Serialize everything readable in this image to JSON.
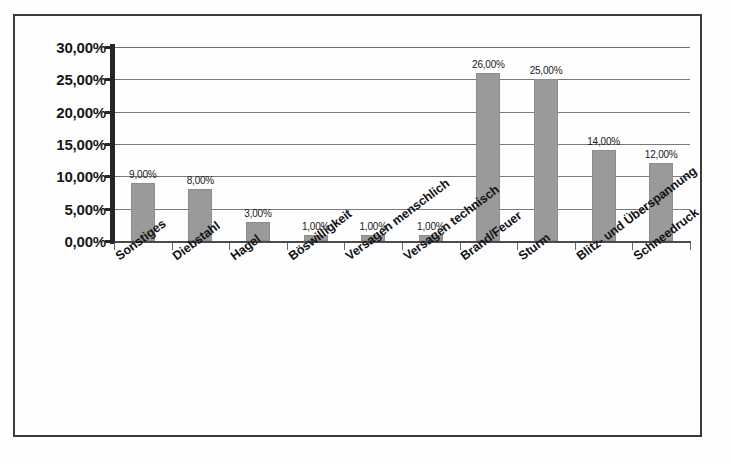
{
  "chart_data": {
    "type": "bar",
    "title": "",
    "subtitle": "",
    "xlabel": "",
    "ylabel": "",
    "categories": [
      "Sonstiges",
      "Diebstahl",
      "Hagel",
      "Böswilligkeit",
      "Versagen menschlich",
      "Versagen technisch",
      "Brand/Feuer",
      "Sturm",
      "Blitz- und Überspannung",
      "Schneedruck"
    ],
    "values": [
      9,
      8,
      3,
      1,
      1,
      1,
      26,
      25,
      14,
      12
    ],
    "value_labels": [
      "9,00%",
      "8,00%",
      "3,00%",
      "1,00%",
      "1,00%",
      "1,00%",
      "26,00%",
      "25,00%",
      "14,00%",
      "12,00%"
    ],
    "ylim": [
      0,
      30
    ],
    "ytick_values": [
      0,
      5,
      10,
      15,
      20,
      25,
      30
    ],
    "ytick_labels": [
      "0,00%",
      "5,00%",
      "10,00%",
      "15,00%",
      "20,00%",
      "25,00%",
      "30,00%"
    ],
    "grid": true,
    "grid_axis": "y",
    "legend": false,
    "legend_position": "none",
    "series": [
      {
        "name": "Schadenursachen",
        "values": [
          9,
          8,
          3,
          1,
          1,
          1,
          26,
          25,
          14,
          12
        ]
      }
    ],
    "colors": {
      "bar_fill": "#9a9a9a",
      "bar_border": "#8d8d8d",
      "gridline": "#7a7a7e",
      "axis": "#262628",
      "text": "#131316",
      "background": "#fefefe",
      "frame_border": "#3a3a3e"
    }
  }
}
